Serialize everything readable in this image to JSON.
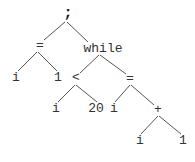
{
  "diagram": {
    "type": "abstract-syntax-tree",
    "line_color": "#555555",
    "nodes": [
      {
        "id": "n0",
        "label": ";",
        "x": 68,
        "y": 14
      },
      {
        "id": "n1",
        "label": "=",
        "x": 40,
        "y": 46
      },
      {
        "id": "n2",
        "label": "while",
        "x": 103,
        "y": 49
      },
      {
        "id": "n3",
        "label": "i",
        "x": 16,
        "y": 78
      },
      {
        "id": "n4",
        "label": "1",
        "x": 58,
        "y": 78
      },
      {
        "id": "n5",
        "label": "<",
        "x": 76,
        "y": 78
      },
      {
        "id": "n6",
        "label": "=",
        "x": 130,
        "y": 79
      },
      {
        "id": "n7",
        "label": "i",
        "x": 56,
        "y": 109
      },
      {
        "id": "n8",
        "label": "20",
        "x": 96,
        "y": 109
      },
      {
        "id": "n9",
        "label": "i",
        "x": 114,
        "y": 109
      },
      {
        "id": "n10",
        "label": "+",
        "x": 158,
        "y": 110
      },
      {
        "id": "n11",
        "label": "i",
        "x": 140,
        "y": 141
      },
      {
        "id": "n12",
        "label": "1",
        "x": 183,
        "y": 141
      }
    ],
    "edges": [
      {
        "from": "n0",
        "to": "n1",
        "x1": 65,
        "y1": 22,
        "x2": 44,
        "y2": 40
      },
      {
        "from": "n0",
        "to": "n2",
        "x1": 67,
        "y1": 22,
        "x2": 88,
        "y2": 42
      },
      {
        "from": "n1",
        "to": "n3",
        "x1": 37,
        "y1": 52,
        "x2": 18,
        "y2": 71
      },
      {
        "from": "n1",
        "to": "n4",
        "x1": 38,
        "y1": 52,
        "x2": 57,
        "y2": 71
      },
      {
        "from": "n2",
        "to": "n5",
        "x1": 99,
        "y1": 55,
        "x2": 80,
        "y2": 73
      },
      {
        "from": "n2",
        "to": "n6",
        "x1": 100,
        "y1": 55,
        "x2": 126,
        "y2": 74
      },
      {
        "from": "n5",
        "to": "n7",
        "x1": 75,
        "y1": 85,
        "x2": 58,
        "y2": 102
      },
      {
        "from": "n5",
        "to": "n8",
        "x1": 76,
        "y1": 85,
        "x2": 97,
        "y2": 102
      },
      {
        "from": "n6",
        "to": "n9",
        "x1": 130,
        "y1": 85,
        "x2": 115,
        "y2": 102
      },
      {
        "from": "n6",
        "to": "n10",
        "x1": 131,
        "y1": 85,
        "x2": 154,
        "y2": 105
      },
      {
        "from": "n10",
        "to": "n11",
        "x1": 158,
        "y1": 116,
        "x2": 141,
        "y2": 134
      },
      {
        "from": "n10",
        "to": "n12",
        "x1": 159,
        "y1": 116,
        "x2": 181,
        "y2": 134
      }
    ]
  }
}
